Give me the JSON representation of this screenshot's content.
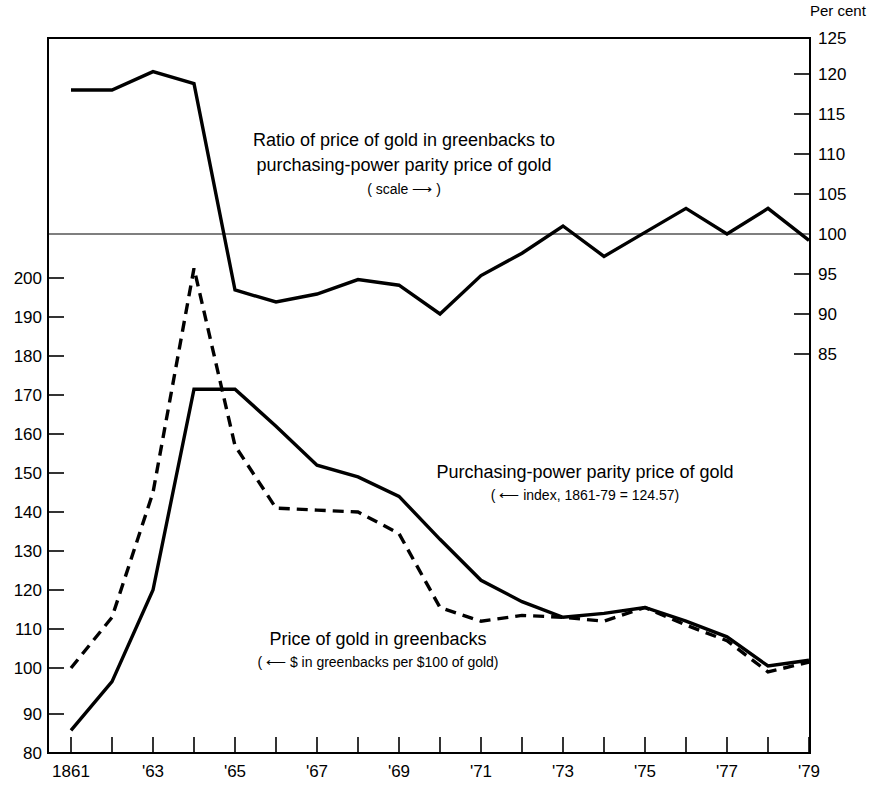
{
  "figure": {
    "right_axis_unit_label": "Per cent",
    "background_color": "#ffffff",
    "line_color": "#000000"
  },
  "annotations": {
    "ratio": {
      "line1": "Ratio of price of gold in greenbacks to",
      "line2": "purchasing-power parity price of gold",
      "line3": "( scale ⟶ )"
    },
    "ppp": {
      "line1": "Purchasing-power parity price of gold",
      "line2": "( ⟵ index, 1861-79 = 124.57)"
    },
    "greenbacks": {
      "line1": "Price of gold in greenbacks",
      "line2": "( ⟵ $ in greenbacks per $100 of gold)"
    }
  },
  "axes": {
    "left": {
      "label": "",
      "ticks": [
        "200",
        "190",
        "180",
        "170",
        "160",
        "150",
        "140",
        "130",
        "120",
        "110",
        "100",
        "90",
        "80"
      ],
      "tick_values": [
        200,
        190,
        180,
        170,
        160,
        150,
        140,
        130,
        120,
        110,
        100,
        90,
        80
      ],
      "range": [
        80,
        212
      ]
    },
    "right": {
      "label": "Per cent",
      "ticks": [
        "125",
        "120",
        "115",
        "110",
        "105",
        "100",
        "95",
        "90",
        "85"
      ],
      "tick_values": [
        125,
        120,
        115,
        110,
        105,
        100,
        95,
        90,
        85
      ],
      "range": [
        81.5,
        125
      ]
    },
    "bottom": {
      "labels": [
        "1861",
        "'63",
        "'65",
        "'67",
        "'69",
        "'71",
        "'73",
        "'75",
        "'77",
        "'79"
      ],
      "label_years": [
        1861,
        1863,
        1865,
        1867,
        1869,
        1871,
        1873,
        1875,
        1877,
        1879
      ],
      "tick_years": [
        1861,
        1862,
        1863,
        1864,
        1865,
        1866,
        1867,
        1868,
        1869,
        1870,
        1871,
        1872,
        1873,
        1874,
        1875,
        1876,
        1877,
        1878,
        1879
      ],
      "range": [
        1861,
        1879
      ]
    }
  },
  "chart_data": {
    "type": "line",
    "title": "",
    "subtitle": "",
    "xlabel": "",
    "ylabel": "",
    "ylim": [
      80,
      212
    ],
    "y2lim": [
      81.5,
      125
    ],
    "xlim": [
      1861,
      1879
    ],
    "grid": false,
    "legend_position": "inline-annotations",
    "x": [
      1861,
      1862,
      1863,
      1864,
      1865,
      1866,
      1867,
      1868,
      1869,
      1870,
      1871,
      1872,
      1873,
      1874,
      1875,
      1876,
      1877,
      1878,
      1879
    ],
    "series": [
      {
        "name": "Ratio of price of gold in greenbacks to purchasing-power parity price of gold",
        "axis": "right",
        "unit": "Per cent",
        "style": "solid",
        "values": [
          118.0,
          118.0,
          120.3,
          118.8,
          93.0,
          91.5,
          92.5,
          94.3,
          93.6,
          90.0,
          94.8,
          97.6,
          101.0,
          97.2,
          100.2,
          103.2,
          100.0,
          103.2,
          99.2
        ]
      },
      {
        "name": "Purchasing-power parity price of gold",
        "axis": "left",
        "unit": "index, 1861-79 = 124.57",
        "style": "solid",
        "values": [
          84.0,
          96.5,
          120.0,
          171.5,
          171.5,
          162.0,
          152.0,
          149.0,
          144.0,
          133.0,
          122.5,
          117.0,
          113.0,
          114.0,
          115.5,
          112.0,
          108.0,
          100.5,
          102.0
        ]
      },
      {
        "name": "Price of gold in greenbacks",
        "axis": "left",
        "unit": "$ in greenbacks per $100 of gold",
        "style": "dashed",
        "values": [
          100.0,
          113.0,
          145.0,
          202.5,
          157.0,
          141.0,
          140.5,
          140.0,
          134.5,
          115.5,
          112.0,
          113.5,
          113.0,
          112.0,
          115.5,
          111.0,
          107.0,
          99.0,
          101.5
        ]
      }
    ]
  }
}
